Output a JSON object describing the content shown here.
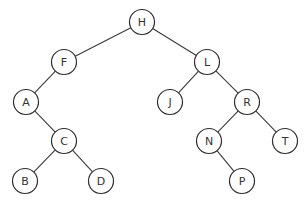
{
  "diagram": {
    "type": "binary-search-tree",
    "root": "H",
    "nodes": [
      {
        "id": "H",
        "label": "H"
      },
      {
        "id": "F",
        "label": "F"
      },
      {
        "id": "L",
        "label": "L"
      },
      {
        "id": "A",
        "label": "A"
      },
      {
        "id": "J",
        "label": "J"
      },
      {
        "id": "R",
        "label": "R"
      },
      {
        "id": "C",
        "label": "C"
      },
      {
        "id": "N",
        "label": "N"
      },
      {
        "id": "T",
        "label": "T"
      },
      {
        "id": "B",
        "label": "B"
      },
      {
        "id": "D",
        "label": "D"
      },
      {
        "id": "P",
        "label": "P"
      }
    ],
    "edges": [
      {
        "from": "H",
        "to": "F",
        "side": "left"
      },
      {
        "from": "H",
        "to": "L",
        "side": "right"
      },
      {
        "from": "F",
        "to": "A",
        "side": "left"
      },
      {
        "from": "A",
        "to": "C",
        "side": "right"
      },
      {
        "from": "C",
        "to": "B",
        "side": "left"
      },
      {
        "from": "C",
        "to": "D",
        "side": "right"
      },
      {
        "from": "L",
        "to": "J",
        "side": "left"
      },
      {
        "from": "L",
        "to": "R",
        "side": "right"
      },
      {
        "from": "R",
        "to": "N",
        "side": "left"
      },
      {
        "from": "R",
        "to": "T",
        "side": "right"
      },
      {
        "from": "N",
        "to": "P",
        "side": "right"
      }
    ]
  }
}
